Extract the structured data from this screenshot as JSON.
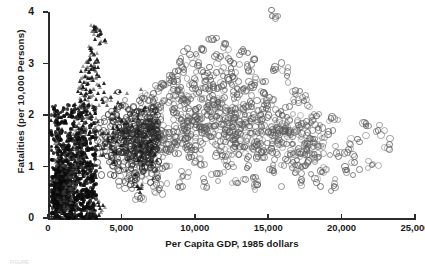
{
  "figure": {
    "caption_fragment": "FIGURE"
  },
  "chart_data": {
    "type": "scatter",
    "title": "",
    "xlabel": "Per Capita GDP, 1985 dollars",
    "ylabel": "Fatalities (per 10,000 Persons)",
    "xlim": [
      0,
      25000
    ],
    "ylim": [
      0,
      4
    ],
    "grid": false,
    "legend": "none",
    "xticks": [
      0,
      5000,
      10000,
      15000,
      20000,
      25000
    ],
    "xticklabels": [
      "0",
      "5,000",
      "10,000",
      "15,000",
      "20,000",
      "25,000"
    ],
    "yticks": [
      0,
      1,
      2,
      3,
      4
    ],
    "yticklabels": [
      "0",
      "1",
      "2",
      "3",
      "4"
    ],
    "series": [
      {
        "name": "low-income-countries",
        "marker": "triangle",
        "color": "#141414",
        "points": [
          [
            3200,
            3.72
          ],
          [
            3320,
            3.7
          ],
          [
            3280,
            3.62
          ],
          [
            3150,
            3.66
          ],
          [
            3620,
            3.58
          ],
          [
            3900,
            3.45
          ],
          [
            3560,
            3.4
          ],
          [
            2950,
            3.3
          ],
          [
            3050,
            3.22
          ],
          [
            3180,
            3.18
          ],
          [
            2880,
            3.1
          ],
          [
            3420,
            3.05
          ],
          [
            2760,
            3.02
          ],
          [
            2980,
            2.96
          ],
          [
            3240,
            2.92
          ],
          [
            2640,
            2.88
          ],
          [
            2820,
            2.84
          ],
          [
            3360,
            2.8
          ],
          [
            2560,
            2.76
          ],
          [
            2900,
            2.72
          ],
          [
            3100,
            2.68
          ],
          [
            2480,
            2.64
          ],
          [
            2720,
            2.6
          ],
          [
            3540,
            2.58
          ],
          [
            2400,
            2.54
          ],
          [
            2660,
            2.5
          ],
          [
            3000,
            2.46
          ],
          [
            2320,
            2.42
          ],
          [
            2580,
            2.38
          ],
          [
            2840,
            2.34
          ],
          [
            3280,
            2.3
          ],
          [
            2240,
            2.26
          ],
          [
            2500,
            2.22
          ],
          [
            2780,
            2.18
          ],
          [
            3120,
            2.14
          ],
          [
            2160,
            2.1
          ],
          [
            2420,
            2.06
          ],
          [
            2700,
            2.02
          ],
          [
            3040,
            1.98
          ],
          [
            2080,
            1.94
          ],
          [
            2340,
            1.9
          ],
          [
            2620,
            1.86
          ],
          [
            2960,
            1.82
          ],
          [
            2000,
            1.78
          ],
          [
            2260,
            1.74
          ],
          [
            2540,
            1.7
          ],
          [
            2880,
            1.66
          ],
          [
            1920,
            1.62
          ],
          [
            2180,
            1.58
          ],
          [
            2460,
            1.54
          ],
          [
            1840,
            1.5
          ],
          [
            2100,
            1.46
          ],
          [
            2380,
            1.42
          ],
          [
            1760,
            1.38
          ],
          [
            2020,
            1.34
          ],
          [
            2300,
            1.3
          ],
          [
            1680,
            1.26
          ],
          [
            1940,
            1.22
          ],
          [
            2220,
            1.18
          ],
          [
            1600,
            1.14
          ],
          [
            1860,
            1.1
          ],
          [
            2140,
            1.06
          ],
          [
            1520,
            1.02
          ],
          [
            1780,
            0.98
          ],
          [
            2060,
            0.94
          ],
          [
            1440,
            0.9
          ],
          [
            1700,
            0.86
          ],
          [
            1980,
            0.82
          ],
          [
            1360,
            0.78
          ],
          [
            1620,
            0.74
          ],
          [
            1900,
            0.7
          ],
          [
            1280,
            0.66
          ],
          [
            1540,
            0.62
          ],
          [
            1820,
            0.58
          ],
          [
            1200,
            0.54
          ],
          [
            1460,
            0.5
          ],
          [
            1740,
            0.46
          ],
          [
            1120,
            0.42
          ],
          [
            1380,
            0.38
          ],
          [
            1660,
            0.34
          ],
          [
            1040,
            0.3
          ],
          [
            1300,
            0.26
          ],
          [
            1580,
            0.22
          ],
          [
            960,
            0.18
          ],
          [
            1220,
            0.14
          ],
          [
            1500,
            0.1
          ],
          [
            880,
            0.22
          ],
          [
            1140,
            0.3
          ],
          [
            1420,
            0.4
          ],
          [
            800,
            0.5
          ],
          [
            1060,
            0.6
          ],
          [
            1340,
            0.7
          ],
          [
            720,
            0.8
          ],
          [
            980,
            0.9
          ],
          [
            1260,
            1.0
          ],
          [
            640,
            1.1
          ],
          [
            900,
            1.2
          ],
          [
            1180,
            1.3
          ],
          [
            560,
            1.4
          ],
          [
            820,
            1.5
          ],
          [
            4300,
            2.35
          ],
          [
            4600,
            2.1
          ],
          [
            4900,
            1.95
          ],
          [
            5200,
            1.7
          ],
          [
            4100,
            1.55
          ],
          [
            3800,
            2.25
          ],
          [
            4450,
            1.3
          ],
          [
            5600,
            1.15
          ],
          [
            6100,
            0.62
          ],
          [
            6400,
            0.58
          ],
          [
            2900,
            0.08
          ],
          [
            3050,
            0.12
          ],
          [
            3300,
            0.05
          ],
          [
            3600,
            0.18
          ],
          [
            3450,
            0.3
          ]
        ]
      },
      {
        "name": "high-income-countries",
        "marker": "open-circle",
        "color": "#5a5a5a",
        "points": [
          [
            15200,
            3.95
          ],
          [
            11100,
            3.5
          ],
          [
            12000,
            3.4
          ],
          [
            10400,
            3.3
          ],
          [
            13100,
            3.25
          ],
          [
            9600,
            3.2
          ],
          [
            11700,
            3.15
          ],
          [
            14000,
            3.1
          ],
          [
            8900,
            3.05
          ],
          [
            12600,
            3.02
          ],
          [
            10100,
            2.98
          ],
          [
            15400,
            2.95
          ],
          [
            9200,
            2.9
          ],
          [
            13600,
            2.88
          ],
          [
            11400,
            2.84
          ],
          [
            8400,
            2.8
          ],
          [
            16200,
            2.78
          ],
          [
            12200,
            2.74
          ],
          [
            10700,
            2.7
          ],
          [
            14600,
            2.66
          ],
          [
            7800,
            2.62
          ],
          [
            11900,
            2.6
          ],
          [
            9000,
            2.56
          ],
          [
            13200,
            2.52
          ],
          [
            16800,
            2.5
          ],
          [
            10200,
            2.46
          ],
          [
            12800,
            2.42
          ],
          [
            8200,
            2.38
          ],
          [
            15000,
            2.36
          ],
          [
            11200,
            2.32
          ],
          [
            9500,
            2.28
          ],
          [
            13800,
            2.24
          ],
          [
            7400,
            2.2
          ],
          [
            16400,
            2.18
          ],
          [
            10800,
            2.14
          ],
          [
            12400,
            2.1
          ],
          [
            8700,
            2.06
          ],
          [
            14400,
            2.02
          ],
          [
            18200,
            2.0
          ],
          [
            11600,
            1.96
          ],
          [
            9800,
            1.92
          ],
          [
            13400,
            1.88
          ],
          [
            7000,
            1.84
          ],
          [
            17000,
            1.82
          ],
          [
            10500,
            1.78
          ],
          [
            12000,
            1.74
          ],
          [
            8500,
            1.7
          ],
          [
            15600,
            1.66
          ],
          [
            19000,
            1.64
          ],
          [
            11000,
            1.6
          ],
          [
            9300,
            1.56
          ],
          [
            13000,
            1.52
          ],
          [
            6600,
            1.48
          ],
          [
            17600,
            1.46
          ],
          [
            10000,
            1.42
          ],
          [
            12600,
            1.38
          ],
          [
            8000,
            1.34
          ],
          [
            14800,
            1.3
          ],
          [
            19600,
            1.28
          ],
          [
            11800,
            1.24
          ],
          [
            9700,
            1.2
          ],
          [
            13500,
            1.16
          ],
          [
            6300,
            1.12
          ],
          [
            16600,
            1.1
          ],
          [
            10300,
            1.06
          ],
          [
            12200,
            1.02
          ],
          [
            7700,
            0.98
          ],
          [
            15200,
            0.94
          ],
          [
            18600,
            0.92
          ],
          [
            11400,
            0.88
          ],
          [
            9100,
            0.84
          ],
          [
            13900,
            0.82
          ],
          [
            6000,
            0.78
          ],
          [
            17200,
            0.76
          ],
          [
            10600,
            0.72
          ],
          [
            12900,
            0.7
          ],
          [
            7300,
            0.68
          ],
          [
            14200,
            0.66
          ],
          [
            19400,
            0.64
          ],
          [
            8800,
            0.62
          ],
          [
            5800,
            0.88
          ],
          [
            6200,
            0.4
          ],
          [
            6900,
            1.0
          ],
          [
            7500,
            0.56
          ],
          [
            20400,
            1.35
          ],
          [
            21000,
            1.55
          ],
          [
            21600,
            1.85
          ],
          [
            22400,
            1.72
          ],
          [
            20800,
            1.1
          ],
          [
            22000,
            1.05
          ],
          [
            23200,
            1.45
          ],
          [
            20200,
            0.95
          ],
          [
            18000,
            1.55
          ],
          [
            19200,
            1.95
          ],
          [
            17400,
            2.3
          ],
          [
            16000,
            1.72
          ],
          [
            15800,
            2.1
          ],
          [
            14600,
            2.45
          ],
          [
            13800,
            2.6
          ],
          [
            12400,
            2.92
          ],
          [
            5400,
            1.25
          ],
          [
            5900,
            1.62
          ],
          [
            6500,
            2.05
          ],
          [
            7100,
            2.3
          ],
          [
            7600,
            2.55
          ],
          [
            8300,
            2.68
          ],
          [
            9000,
            2.4
          ],
          [
            9800,
            2.62
          ],
          [
            10500,
            2.85
          ],
          [
            11200,
            2.55
          ],
          [
            5200,
            0.72
          ],
          [
            5600,
            1.05
          ],
          [
            6800,
            1.42
          ],
          [
            7200,
            1.68
          ],
          [
            8600,
            1.48
          ],
          [
            9400,
            1.72
          ],
          [
            10100,
            1.95
          ],
          [
            11500,
            2.18
          ],
          [
            12700,
            1.65
          ],
          [
            13300,
            1.4
          ]
        ]
      }
    ],
    "dense_cluster": {
      "description": "Very dense near-solid black cluster of low-income observations",
      "x_range": [
        200,
        3300
      ],
      "y_range": [
        0.0,
        2.2
      ],
      "peak_x_range": [
        400,
        1800
      ],
      "peak_y_range": [
        0.1,
        1.4
      ]
    }
  }
}
